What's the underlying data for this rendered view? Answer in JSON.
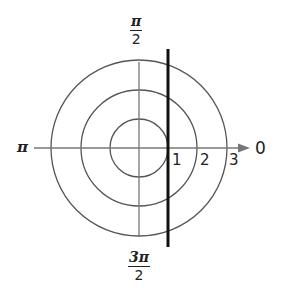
{
  "diagram": {
    "type": "polar-coordinate-graph",
    "angle_labels": {
      "right": "0",
      "top_num": "π",
      "top_den": "2",
      "left": "π",
      "bottom_num": "3π",
      "bottom_den": "2"
    },
    "radius_labels": [
      "1",
      "2",
      "3"
    ],
    "circles_radii": [
      1,
      2,
      3
    ],
    "graphed_line": {
      "equation": "r cos θ = 1",
      "x": 1
    },
    "colors": {
      "grid": "#555555",
      "line": "#111111"
    }
  }
}
